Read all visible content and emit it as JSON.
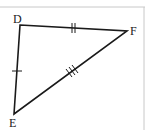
{
  "diagram": {
    "type": "triangle",
    "vertices": [
      {
        "label": "D",
        "x": 20,
        "y": 25,
        "label_x": 13,
        "label_y": 23
      },
      {
        "label": "F",
        "x": 127,
        "y": 31,
        "label_x": 130,
        "label_y": 35
      },
      {
        "label": "E",
        "x": 14,
        "y": 114,
        "label_x": 9,
        "label_y": 127
      }
    ],
    "sides": [
      {
        "from": "D",
        "to": "E",
        "tick_marks": 1
      },
      {
        "from": "D",
        "to": "F",
        "tick_marks": 2
      },
      {
        "from": "E",
        "to": "F",
        "tick_marks": 3
      }
    ],
    "colors": {
      "line": "#1a1a1a",
      "border": "#c8c8c8"
    }
  }
}
